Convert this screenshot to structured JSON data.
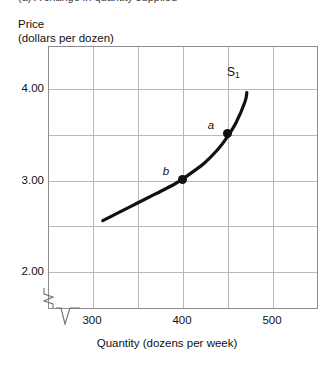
{
  "caption": {
    "text": "(a) A change in quantity supplied"
  },
  "chart_data": {
    "type": "line",
    "title": "",
    "subtitle": "",
    "ylabel_line1": "Price",
    "ylabel_line2": "(dollars per dozen)",
    "xlabel": "Quantity (dozens per week)",
    "xlim": [
      290,
      490
    ],
    "ylim": [
      1.9,
      4.35
    ],
    "grid": true,
    "legend_position": "none",
    "x_ticks": [
      {
        "value": 300,
        "label": "300"
      },
      {
        "value": 350,
        "label": ""
      },
      {
        "value": 400,
        "label": "400"
      },
      {
        "value": 450,
        "label": ""
      },
      {
        "value": 500,
        "label": "500"
      }
    ],
    "y_ticks": [
      {
        "value": 4.0,
        "label": "4.00"
      },
      {
        "value": 3.5,
        "label": ""
      },
      {
        "value": 3.0,
        "label": "3.00"
      },
      {
        "value": 2.5,
        "label": ""
      },
      {
        "value": 2.0,
        "label": "2.00"
      }
    ],
    "axis_breaks": {
      "y_axis": "zigzag-break",
      "x_axis": "v-notch-break"
    },
    "series": [
      {
        "name": "S1",
        "label": "S",
        "label_subscript": "1",
        "type": "supply-curve",
        "color": "#111111",
        "x": [
          312,
          330,
          350,
          370,
          390,
          400,
          410,
          425,
          440,
          450,
          460,
          470,
          472
        ],
        "y": [
          2.55,
          2.64,
          2.74,
          2.84,
          2.94,
          3.0,
          3.07,
          3.18,
          3.33,
          3.46,
          3.62,
          3.85,
          3.95
        ]
      }
    ],
    "annotations": [
      {
        "name": "a",
        "label": "a",
        "x": 450,
        "y": 3.5,
        "marker": "filled-circle",
        "label_dx": -16,
        "label_dy": -9
      },
      {
        "name": "b",
        "label": "b",
        "x": 400,
        "y": 3.0,
        "marker": "filled-circle",
        "label_dx": -16,
        "label_dy": -9
      }
    ],
    "curve_label": {
      "text": "S",
      "subscript": "1",
      "x": 457,
      "y": 4.17
    }
  }
}
